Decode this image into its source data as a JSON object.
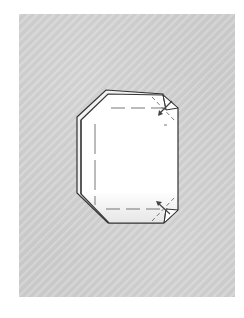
{
  "diagram": {
    "type": "origami-fold-step",
    "background_color": "#cfcfcf",
    "paper_color": "#ffffff",
    "line_color": "#333333",
    "fold_line_color": "#555555",
    "arrows": [
      {
        "name": "fold-arrow-top-right",
        "direction": "toward-center"
      },
      {
        "name": "fold-arrow-bottom-right",
        "direction": "toward-center"
      }
    ]
  }
}
